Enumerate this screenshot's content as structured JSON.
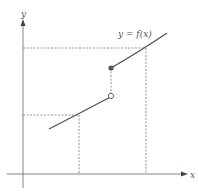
{
  "diagram": {
    "function_label": "y = f(x)",
    "axes": {
      "x_label": "x",
      "y_label": "y"
    },
    "colors": {
      "curve": "#555555",
      "axis": "#666666",
      "dashed": "#777777",
      "filled_point": "#555555",
      "open_point_fill": "#ffffff"
    },
    "points": [
      {
        "name": "open-endpoint",
        "type": "open"
      },
      {
        "name": "closed-endpoint",
        "type": "filled"
      }
    ]
  }
}
